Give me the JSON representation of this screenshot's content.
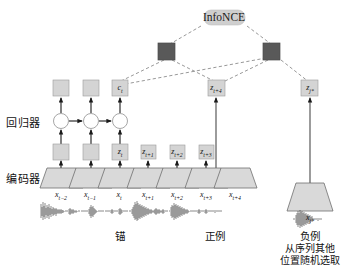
{
  "diagram": {
    "title_node": {
      "label": "InfoNCE"
    },
    "side_labels": {
      "regressor": "回归器",
      "encoder": "编码器"
    },
    "latent_boxes": [
      {
        "name": "z-box-1",
        "label": "",
        "sub": ""
      },
      {
        "name": "z-box-2",
        "label": "",
        "sub": ""
      },
      {
        "name": "z-box-t",
        "label": "z",
        "sub": "t"
      },
      {
        "name": "z-box-t1",
        "label": "z",
        "sub": "t+1"
      },
      {
        "name": "z-box-t2",
        "label": "z",
        "sub": "t+2"
      },
      {
        "name": "z-box-t3",
        "label": "z",
        "sub": "t+3"
      }
    ],
    "context_boxes": [
      {
        "name": "c-box-1",
        "label": "",
        "sub": ""
      },
      {
        "name": "c-box-2",
        "label": "",
        "sub": ""
      },
      {
        "name": "c-box-t",
        "label": "c",
        "sub": "t"
      }
    ],
    "target_box": {
      "label": "z",
      "sub": "t+4"
    },
    "negative_box": {
      "label": "z",
      "sub": "j*"
    },
    "input_labels": [
      {
        "label": "x",
        "sub": "t−2"
      },
      {
        "label": "x",
        "sub": "t−1"
      },
      {
        "label": "x",
        "sub": "t"
      },
      {
        "label": "x",
        "sub": "t+1"
      },
      {
        "label": "x",
        "sub": "t+2"
      },
      {
        "label": "x",
        "sub": "t+3"
      },
      {
        "label": "x",
        "sub": "t+4"
      }
    ],
    "negative_input_label": {
      "label": "x",
      "sub": "j*"
    },
    "captions": {
      "anchor": "锚",
      "positive": "正例",
      "negative": "负例",
      "negative_note_line1": "从序列其他",
      "negative_note_line2": "位置随机选取"
    },
    "colors": {
      "box_fill": "#d4d4d4",
      "dark_square_fill": "#595959",
      "trapezoid_fill": "#d9d9d9",
      "circle_fill": "#ffffff",
      "stroke": "#4a4a4a",
      "arrow": "#1a1a1a",
      "dashed": "#8a8a8a",
      "infonce_fill": "#cfcfcf"
    }
  }
}
